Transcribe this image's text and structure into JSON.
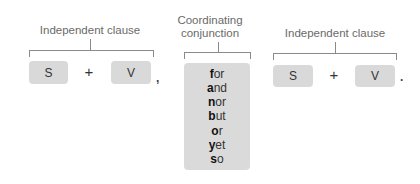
{
  "left_clause": {
    "title": "Independent clause",
    "subject": "S",
    "operator": "+",
    "verb": "V",
    "trailing_punctuation": ","
  },
  "conjunction": {
    "title_line1": "Coordinating",
    "title_line2": "conjunction",
    "words": [
      {
        "first": "f",
        "rest": "or"
      },
      {
        "first": "a",
        "rest": "nd"
      },
      {
        "first": "n",
        "rest": "or"
      },
      {
        "first": "b",
        "rest": "ut"
      },
      {
        "first": "o",
        "rest": "r"
      },
      {
        "first": "y",
        "rest": "et"
      },
      {
        "first": "s",
        "rest": "o"
      }
    ]
  },
  "right_clause": {
    "title": "Independent clause",
    "subject": "S",
    "operator": "+",
    "verb": "V",
    "trailing_punctuation": "."
  },
  "colors": {
    "box_fill": "#d9d9d9",
    "bracket": "#8a8a8a",
    "label_text": "#6a6a6a"
  }
}
